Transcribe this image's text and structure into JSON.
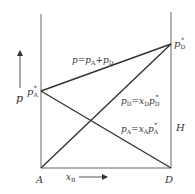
{
  "diagram": {
    "type": "vapor-pressure composition diagram (Raoult's law)",
    "axes": {
      "y_label": "p",
      "x_label": "x",
      "x_label_sub": "B",
      "left_component": "A",
      "right_component": "D",
      "right_marker": "H"
    },
    "points": {
      "pA_star": {
        "main": "p",
        "sub": "A",
        "sup": "*"
      },
      "pD_star": {
        "main": "p",
        "sub": "D",
        "sup": "*"
      }
    },
    "lines": [
      {
        "name": "total",
        "label": "p=pA+pD",
        "from": "pA*",
        "to": "pD*"
      },
      {
        "name": "pD",
        "label": "pD=xDpD*",
        "from": "A (0)",
        "to": "pD*"
      },
      {
        "name": "pA",
        "label": "pA=xApA*",
        "from": "pA*",
        "to": "D (0)"
      }
    ],
    "colors": {
      "line": "#333333",
      "text": "#333333",
      "frame": "#666666"
    }
  }
}
